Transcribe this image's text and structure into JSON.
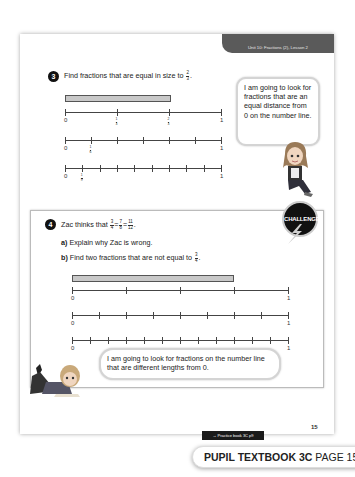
{
  "header": {
    "unit_tab": "Unit 10: Fractions (2), Lesson 2"
  },
  "question3": {
    "number": "3",
    "text": "Find fractions that are equal in size to",
    "fraction": {
      "num": "2",
      "den": "3"
    },
    "suffix": ".",
    "number_lines": [
      {
        "divisions": 3,
        "labels": {
          "start": "0",
          "end": "1"
        },
        "fraction_labels": [
          {
            "num": "1",
            "den": "3"
          },
          {
            "num": "2",
            "den": "3"
          }
        ]
      },
      {
        "divisions": 6,
        "labels": {
          "start": "0",
          "end": "1"
        },
        "fraction_labels": [
          {
            "num": "1",
            "den": "6"
          }
        ]
      },
      {
        "divisions": 9,
        "labels": {
          "start": "0",
          "end": "1"
        },
        "fraction_labels": [
          {
            "num": "1",
            "den": "9"
          }
        ]
      }
    ],
    "speech_bubble": "I am going to look for fractions that are an equal distance from 0 on the number line."
  },
  "question4": {
    "number": "4",
    "intro": "Zac thinks that",
    "fractions": [
      {
        "num": "3",
        "den": "4"
      },
      {
        "num": "7",
        "den": "8"
      },
      {
        "num": "11",
        "den": "12"
      }
    ],
    "part_a": {
      "label": "a)",
      "text": "Explain why Zac is wrong."
    },
    "part_b": {
      "label": "b)",
      "text": "Find two fractions that are not equal to",
      "fraction": {
        "num": "3",
        "den": "4"
      }
    },
    "challenge_badge": "CHALLENGE",
    "number_lines": [
      {
        "divisions": 4,
        "labels": {
          "start": "0",
          "end": "1"
        }
      },
      {
        "divisions": 8,
        "labels": {
          "start": "0",
          "end": "1"
        }
      },
      {
        "divisions": 12,
        "labels": {
          "start": "0",
          "end": "1"
        }
      }
    ],
    "speech_bubble": "I am going to look for fractions on the number line that are different lengths from 0."
  },
  "footer": {
    "page_number": "15",
    "practice_link": "→ Practice book 3C p9",
    "book_title": "PUPIL TEXTBOOK 3C",
    "page_label": "PAGE 15"
  }
}
